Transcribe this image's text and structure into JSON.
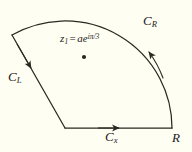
{
  "figure": {
    "type": "contour-diagram",
    "background_color": "#fefef2",
    "stroke_color": "#2b2823",
    "labels": {
      "arc": "C",
      "arc_subscript": "R",
      "left_ray": "C",
      "left_ray_subscript": "L",
      "real_axis": "C",
      "real_axis_subscript": "x",
      "radius_endpoint": "R",
      "pole_symbol": "z",
      "pole_subscript": "1",
      "pole_equals": "=",
      "pole_value_base": "ae",
      "pole_value_exponent": "iπ/3"
    },
    "geometry": {
      "origin": [
        65,
        128
      ],
      "radius": 107,
      "sector_start_angle_deg": 0,
      "sector_end_angle_deg": 60,
      "arc_start_point": [
        172,
        128
      ],
      "arc_end_point": [
        12,
        35
      ],
      "pole_point": [
        84,
        57
      ],
      "arrow_directions": {
        "real_axis": "right",
        "arc": "counterclockwise-toward-upper-left",
        "left_ray": "toward-origin-downward"
      }
    }
  }
}
